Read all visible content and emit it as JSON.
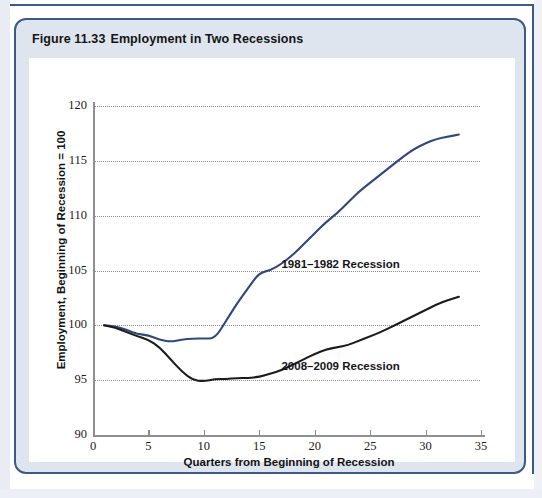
{
  "figure": {
    "number": "Figure 11.33",
    "title": "Employment in Two Recessions"
  },
  "chart_data": {
    "type": "line",
    "title": "Employment in Two Recessions",
    "xlabel": "Quarters from Beginning of Recession",
    "ylabel": "Employment, Beginning of Recession = 100",
    "xlim": [
      0,
      35
    ],
    "ylim": [
      90,
      120
    ],
    "xticks": [
      0,
      5,
      10,
      15,
      20,
      25,
      30,
      35
    ],
    "yticks": [
      90,
      95,
      100,
      105,
      110,
      115,
      120
    ],
    "grid": "horizontal-dotted",
    "legend": "inline-annotations",
    "series": [
      {
        "name": "1981–1982 Recession",
        "color": "#30477c",
        "x": [
          1,
          2,
          3,
          4,
          5,
          6,
          7,
          8,
          9,
          10,
          11,
          12,
          13,
          14,
          15,
          16,
          17,
          18,
          19,
          20,
          21,
          22,
          23,
          24,
          25,
          26,
          27,
          28,
          29,
          30,
          31,
          32,
          33
        ],
        "values": [
          100.0,
          99.9,
          99.6,
          99.2,
          99.1,
          98.7,
          98.5,
          98.7,
          98.8,
          98.8,
          98.8,
          100.4,
          102.0,
          103.4,
          104.8,
          105.0,
          105.6,
          106.4,
          107.4,
          108.4,
          109.4,
          110.2,
          111.2,
          112.2,
          113.0,
          113.8,
          114.6,
          115.4,
          116.1,
          116.6,
          117.0,
          117.2,
          117.4
        ]
      },
      {
        "name": "2008–2009 Recession",
        "color": "#1b1b1b",
        "x": [
          1,
          2,
          3,
          4,
          5,
          6,
          7,
          8,
          9,
          10,
          11,
          12,
          13,
          14,
          15,
          16,
          17,
          18,
          19,
          20,
          21,
          22,
          23,
          24,
          25,
          26,
          27,
          28,
          29,
          30,
          31,
          32,
          33
        ],
        "values": [
          100.0,
          99.8,
          99.4,
          99.0,
          98.7,
          98.0,
          96.9,
          95.8,
          95.0,
          94.9,
          95.1,
          95.1,
          95.2,
          95.2,
          95.3,
          95.6,
          95.9,
          96.4,
          96.9,
          97.4,
          97.8,
          98.0,
          98.2,
          98.6,
          99.0,
          99.4,
          99.9,
          100.4,
          100.9,
          101.4,
          101.9,
          102.3,
          102.6
        ]
      }
    ],
    "annotations": [
      {
        "text": "1981–1982 Recession",
        "x": 17,
        "y": 105.5
      },
      {
        "text": "2008–2009 Recession",
        "x": 17,
        "y": 96.2
      }
    ]
  },
  "colors": {
    "frame_border": "#3d5a86",
    "figure_background": "#dfe5ee",
    "panel_background": "#ffffff",
    "series_1981": "#30477c",
    "series_2008": "#1b1b1b",
    "gridline": "#8a8a8a"
  }
}
